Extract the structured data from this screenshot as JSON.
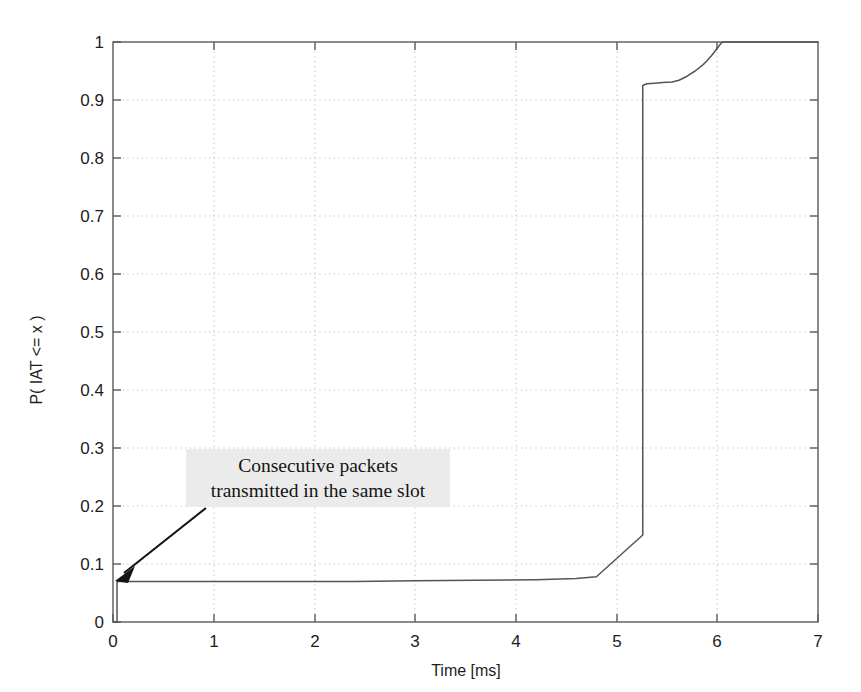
{
  "figure": {
    "background_color": "#ffffff",
    "plot_line_color": "#555555",
    "axis_color": "#5a5a5a",
    "grid_color": "#bdbdbd",
    "annotation_bg_color": "#ebebeb"
  },
  "chart_data": {
    "type": "line",
    "title": "",
    "subtitle": "",
    "xlabel": "Time [ms]",
    "ylabel": "P( IAT <= x )",
    "xlim": [
      0,
      7
    ],
    "ylim": [
      0,
      1
    ],
    "xticks": [
      0,
      1,
      2,
      3,
      4,
      5,
      6,
      7
    ],
    "xticklabels": [
      "0",
      "1",
      "2",
      "3",
      "4",
      "5",
      "6",
      "7"
    ],
    "yticks": [
      0,
      0.1,
      0.2,
      0.3,
      0.4,
      0.5,
      0.6,
      0.7,
      0.8,
      0.9,
      1
    ],
    "yticklabels": [
      "0",
      "0.1",
      "0.2",
      "0.3",
      "0.4",
      "0.5",
      "0.6",
      "0.7",
      "0.8",
      "0.9",
      "1"
    ],
    "grid": true,
    "grid_style": "dotted",
    "legend": null,
    "series": [
      {
        "name": "Empirical CDF of packet inter-arrival time",
        "x": [
          0.0,
          0.04,
          0.04,
          0.6,
          1.2,
          1.8,
          2.4,
          3.0,
          3.6,
          4.2,
          4.6,
          4.8,
          5.26,
          5.26,
          5.3,
          5.38,
          5.46,
          5.55,
          5.62,
          5.7,
          5.78,
          5.86,
          5.9,
          5.94,
          5.98,
          6.02,
          6.05,
          6.12,
          6.3,
          6.6,
          7.0
        ],
        "y": [
          0.0,
          0.0,
          0.07,
          0.07,
          0.07,
          0.07,
          0.07,
          0.071,
          0.072,
          0.073,
          0.075,
          0.078,
          0.15,
          0.925,
          0.928,
          0.929,
          0.93,
          0.931,
          0.934,
          0.941,
          0.95,
          0.961,
          0.968,
          0.976,
          0.985,
          0.994,
          1.0,
          1.0,
          1.0,
          1.0,
          1.0
        ]
      }
    ],
    "annotations": [
      {
        "id": "consecutive-packets-note",
        "line1": "Consecutive packets",
        "line2": "transmitted in the same slot",
        "text": "Consecutive packets transmitted in the same slot",
        "arrow_from": [
          0.92,
          0.285
        ],
        "arrow_to": [
          0.03,
          0.082
        ],
        "has_arrow": true
      }
    ]
  }
}
